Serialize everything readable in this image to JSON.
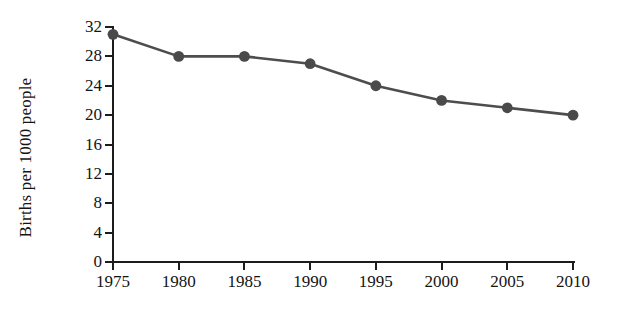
{
  "chart_data": {
    "type": "line",
    "title": "",
    "subtitle": "",
    "xlabel": "",
    "ylabel": "Births per 1000 people",
    "categories": [
      "1975",
      "1980",
      "1985",
      "1990",
      "1995",
      "2000",
      "2005",
      "2010"
    ],
    "x": [
      1975,
      1980,
      1985,
      1990,
      1995,
      2000,
      2005,
      2010
    ],
    "values": [
      31,
      28,
      28,
      27,
      24,
      22,
      21,
      20
    ],
    "series": [
      {
        "name": "Births per 1000 people",
        "values": [
          31,
          28,
          28,
          27,
          24,
          22,
          21,
          20
        ]
      }
    ],
    "xlim": [
      1975,
      2010
    ],
    "ylim": [
      0,
      32
    ],
    "y_ticks": [
      "0",
      "4",
      "8",
      "12",
      "16",
      "20",
      "24",
      "28",
      "32"
    ],
    "y_tick_values": [
      0,
      4,
      8,
      12,
      16,
      20,
      24,
      28,
      32
    ],
    "x_ticks": [
      "1975",
      "1980",
      "1985",
      "1990",
      "1995",
      "2000",
      "2005",
      "2010"
    ],
    "grid": false,
    "legend": false,
    "legend_position": "none",
    "annotations": [],
    "colors": {
      "line": "#4d4d4d",
      "marker": "#4a4a4a",
      "axis": "#1c1c1c",
      "text": "#141414",
      "background": "#ffffff"
    }
  }
}
